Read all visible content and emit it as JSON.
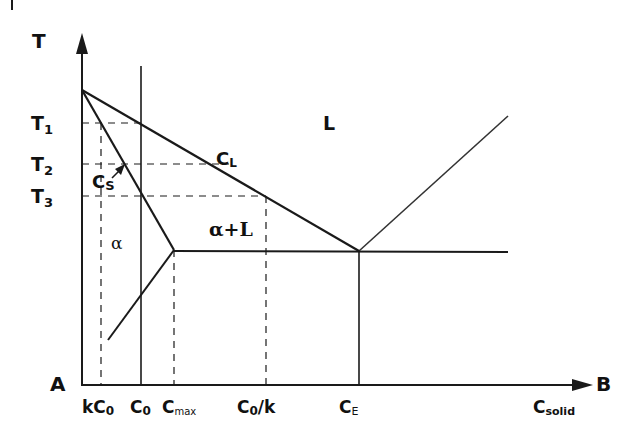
{
  "diagram": {
    "type": "binary eutectic phase diagram with solidification path",
    "axes": {
      "y_label": "T",
      "origin_label": "A",
      "x_end_label": "B",
      "x_title": "C",
      "x_title_sub": "solid"
    },
    "temperature_ticks": [
      {
        "main": "T",
        "sub": "1"
      },
      {
        "main": "T",
        "sub": "2"
      },
      {
        "main": "T",
        "sub": "3"
      }
    ],
    "composition_ticks": [
      {
        "main": "kC",
        "sub": "0",
        "rest": ""
      },
      {
        "main": "C",
        "sub": "0",
        "rest": ""
      },
      {
        "main": "C",
        "sub": "max",
        "rest": ""
      },
      {
        "main": "C",
        "sub": "0",
        "rest": "/k"
      },
      {
        "main": "C",
        "sub": "E",
        "rest": ""
      }
    ],
    "region_labels": {
      "liquid": "L",
      "solid": "α",
      "two_phase": "α+L"
    },
    "line_labels": {
      "liquidus": {
        "main": "C",
        "sub": "L"
      },
      "solidus": {
        "main": "C",
        "sub": "S"
      }
    },
    "corner_mark": "|",
    "colors": {
      "line": "#1a1a1a",
      "background": "#ffffff"
    }
  }
}
